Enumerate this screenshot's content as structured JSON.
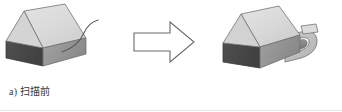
{
  "figure": {
    "type": "process-diagram",
    "background_color": "#ffffff",
    "width": 342,
    "height": 112
  },
  "panels": [
    {
      "id": "before",
      "label": "a) 扫描前",
      "label_marker": "a)",
      "label_text": "扫描前",
      "object_name": "specimen-block",
      "has_probe_wire": true,
      "probe_description": "thin curved probe wire extending up-right from the block edge"
    },
    {
      "id": "after",
      "label": "b) 扫描后",
      "label_marker": "b)",
      "label_text": "扫描后",
      "object_name": "specimen-block",
      "has_scanner_bracket": true,
      "bracket_description": "curved C-shaped scanner bracket clamped onto the right side of the block"
    }
  ],
  "connector": {
    "name": "process-arrow",
    "direction": "right",
    "style": "outlined",
    "stroke_color": "#6b6b6b",
    "fill_color": "#ffffff"
  },
  "colors": {
    "block_top_face": "#dcdcdc",
    "block_front_face": "#4a4a4a",
    "block_side_face": "#9a9a9a",
    "block_outline": "#6e6e6e",
    "bracket_light": "#c6c6c6",
    "bracket_mid": "#8f8f8f",
    "bracket_dark": "#5a5a5a",
    "wire": "#5a5a5a",
    "caption_text": "#3a3a3a",
    "baseline_rule": "#e4e4e4"
  }
}
